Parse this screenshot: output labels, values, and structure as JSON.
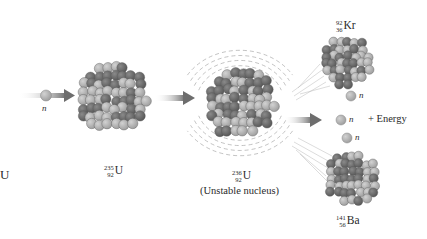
{
  "diagram": {
    "type": "nuclear-fission",
    "colors": {
      "background": "#ffffff",
      "proton": "#6e6e6e",
      "neutron": "#b4b4b4",
      "arrow": "#7a7a7a",
      "text": "#2a2a2a"
    },
    "edge_label": "U",
    "incoming_neutron": {
      "label": "n"
    },
    "uranium_235": {
      "mass": "235",
      "atomic": "92",
      "symbol": "U"
    },
    "uranium_236": {
      "mass": "236",
      "atomic": "92",
      "symbol": "U",
      "caption": "(Unstable nucleus)"
    },
    "krypton": {
      "mass": "92",
      "atomic": "36",
      "symbol": "Kr"
    },
    "barium": {
      "mass": "141",
      "atomic": "56",
      "symbol": "Ba"
    },
    "released_neutrons": [
      {
        "label": "n"
      },
      {
        "label": "n"
      },
      {
        "label": "n"
      }
    ],
    "energy_label": "+ Energy"
  }
}
